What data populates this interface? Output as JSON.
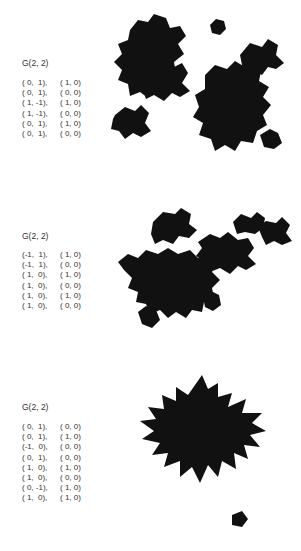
{
  "figures": [
    {
      "title": "G(2, 2)",
      "rows": [
        [
          "( 0,  1),",
          "( 1, 0)"
        ],
        [
          "( 0,  1),",
          "( 0, 0)"
        ],
        [
          "( 1, -1),",
          "( 1, 0)"
        ],
        [
          "( 1, -1),",
          "( 0, 0)"
        ],
        [
          "( 0,  1),",
          "( 1, 0)"
        ],
        [
          "( 0,  1),",
          "( 0, 0)"
        ]
      ]
    },
    {
      "title": "G(2, 2)",
      "rows": [
        [
          "(-1,  1),",
          "( 1, 0)"
        ],
        [
          "(-1,  1),",
          "( 0, 0)"
        ],
        [
          "( 1,  0),",
          "( 1, 0)"
        ],
        [
          "( 1,  0),",
          "( 0, 0)"
        ],
        [
          "( 1,  0),",
          "( 1, 0)"
        ],
        [
          "( 1,  0),",
          "( 0, 0)"
        ]
      ]
    },
    {
      "title": "G(2, 2)",
      "rows": [
        [
          "( 0,  1),",
          "( 0, 0)"
        ],
        [
          "( 0,  1),",
          "( 1, 0)"
        ],
        [
          "(-1,  0),",
          "( 0, 0)"
        ],
        [
          "( 0,  1),",
          "( 0, 0)"
        ],
        [
          "( 1,  0),",
          "( 1, 0)"
        ],
        [
          "( 1,  0),",
          "( 0, 0)"
        ],
        [
          "( 0, -1),",
          "( 1, 0)"
        ],
        [
          "( 1,  0),",
          "( 1, 0)"
        ]
      ]
    }
  ],
  "colors": {
    "fractal": "#111111",
    "text": "#333333"
  }
}
